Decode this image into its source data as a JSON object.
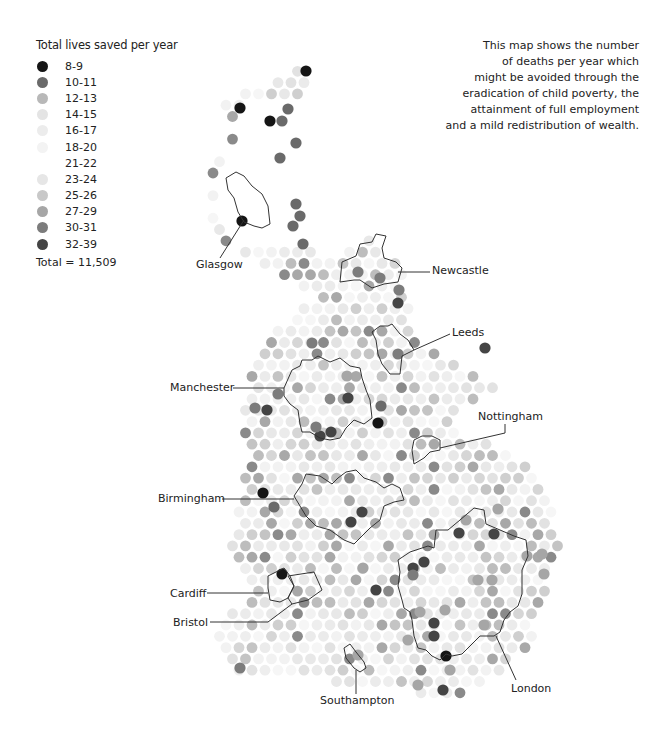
{
  "legend": {
    "title": "Total lives saved per year",
    "items": [
      {
        "label": "8-9",
        "color": "#151515"
      },
      {
        "label": "10-11",
        "color": "#6a6a6a"
      },
      {
        "label": "12-13",
        "color": "#b8b8b8"
      },
      {
        "label": "14-15",
        "color": "#e4e4e4"
      },
      {
        "label": "16-17",
        "color": "#ececec"
      },
      {
        "label": "18-20",
        "color": "#f3f3f3"
      },
      {
        "label": "21-22",
        "color": "#ffffff"
      },
      {
        "label": "23-24",
        "color": "#e6e6e6"
      },
      {
        "label": "25-26",
        "color": "#c8c8c8"
      },
      {
        "label": "27-29",
        "color": "#a6a6a6"
      },
      {
        "label": "30-31",
        "color": "#7c7c7c"
      },
      {
        "label": "32-39",
        "color": "#444444"
      }
    ],
    "total": "Total = 11,509"
  },
  "description": {
    "lines": [
      "This map shows the number",
      "of deaths per year which",
      "might be avoided through the",
      "eradication of child poverty, the",
      "attainment of full employment",
      "and a mild redistribution of wealth."
    ]
  },
  "cities": [
    {
      "name": "Glasgow",
      "label_x": 196,
      "label_y": 268,
      "anchor": "start"
    },
    {
      "name": "Newcastle",
      "label_x": 432,
      "label_y": 274,
      "anchor": "start"
    },
    {
      "name": "Leeds",
      "label_x": 452,
      "label_y": 336,
      "anchor": "start"
    },
    {
      "name": "Manchester",
      "label_x": 170,
      "label_y": 391,
      "anchor": "start"
    },
    {
      "name": "Nottingham",
      "label_x": 478,
      "label_y": 420,
      "anchor": "start"
    },
    {
      "name": "Birmingham",
      "label_x": 158,
      "label_y": 502,
      "anchor": "start"
    },
    {
      "name": "Cardiff",
      "label_x": 170,
      "label_y": 597,
      "anchor": "start"
    },
    {
      "name": "Bristol",
      "label_x": 173,
      "label_y": 626,
      "anchor": "start"
    },
    {
      "name": "Southampton",
      "label_x": 320,
      "label_y": 704,
      "anchor": "start"
    },
    {
      "name": "London",
      "label_x": 511,
      "label_y": 692,
      "anchor": "start"
    }
  ],
  "chart_data": {
    "type": "dot-map",
    "title": "Total lives saved per year",
    "legend_bins": [
      "8-9",
      "10-11",
      "12-13",
      "14-15",
      "16-17",
      "18-20",
      "21-22",
      "23-24",
      "25-26",
      "27-29",
      "30-31",
      "32-39"
    ],
    "total": 11509,
    "labelled_cities": [
      "Glasgow",
      "Newcastle",
      "Leeds",
      "Manchester",
      "Nottingham",
      "Birmingham",
      "Cardiff",
      "Bristol",
      "Southampton",
      "London"
    ]
  }
}
